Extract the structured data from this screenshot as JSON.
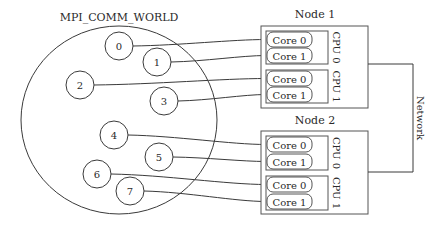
{
  "diagram": {
    "communicator_label": "MPI_COMM_WORLD",
    "processes": [
      {
        "rank": "0",
        "cx": 119,
        "cy": 46,
        "target": {
          "node": 0,
          "cpu": 0,
          "core": 0
        }
      },
      {
        "rank": "1",
        "cx": 157,
        "cy": 62,
        "target": {
          "node": 0,
          "cpu": 0,
          "core": 1
        }
      },
      {
        "rank": "2",
        "cx": 80,
        "cy": 85,
        "target": {
          "node": 0,
          "cpu": 1,
          "core": 0
        }
      },
      {
        "rank": "3",
        "cx": 164,
        "cy": 101,
        "target": {
          "node": 0,
          "cpu": 1,
          "core": 1
        }
      },
      {
        "rank": "4",
        "cx": 114,
        "cy": 135,
        "target": {
          "node": 1,
          "cpu": 0,
          "core": 0
        }
      },
      {
        "rank": "5",
        "cx": 159,
        "cy": 157,
        "target": {
          "node": 1,
          "cpu": 0,
          "core": 1
        }
      },
      {
        "rank": "6",
        "cx": 97,
        "cy": 174,
        "target": {
          "node": 1,
          "cpu": 1,
          "core": 0
        }
      },
      {
        "rank": "7",
        "cx": 130,
        "cy": 191,
        "target": {
          "node": 1,
          "cpu": 1,
          "core": 1
        }
      }
    ],
    "nodes": [
      {
        "label": "Node 1",
        "cpus": [
          {
            "label": "CPU 0",
            "cores": [
              "Core 0",
              "Core 1"
            ]
          },
          {
            "label": "CPU 1",
            "cores": [
              "Core 0",
              "Core 1"
            ]
          }
        ]
      },
      {
        "label": "Node 2",
        "cpus": [
          {
            "label": "CPU 0",
            "cores": [
              "Core 0",
              "Core 1"
            ]
          },
          {
            "label": "CPU 1",
            "cores": [
              "Core 0",
              "Core 1"
            ]
          }
        ]
      }
    ],
    "network_label": "Network",
    "colors": {
      "line": "#3a3a3a",
      "text": "#2a2a2a",
      "background": "#ffffff"
    }
  }
}
